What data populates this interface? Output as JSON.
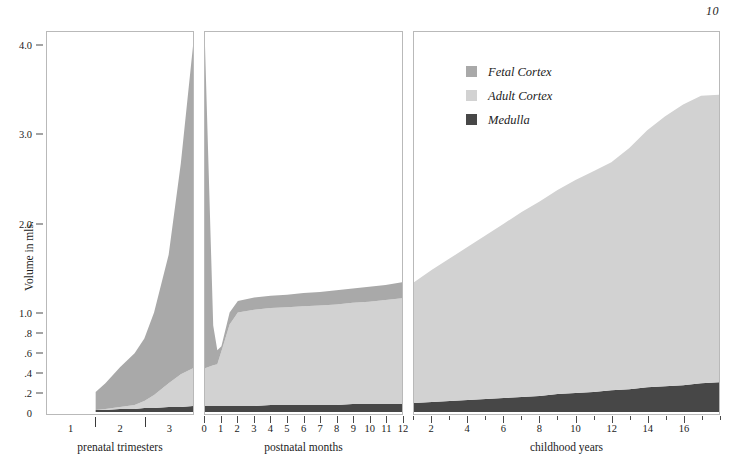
{
  "folio": "10",
  "axis_title": "Volume in mls.",
  "legend": {
    "items": [
      {
        "label": "Fetal Cortex",
        "color": "#a9a9a9"
      },
      {
        "label": "Adult Cortex",
        "color": "#d2d2d2"
      },
      {
        "label": "Medulla",
        "color": "#474747"
      }
    ]
  },
  "colors": {
    "fetal_cortex": "#a9a9a9",
    "adult_cortex": "#d2d2d2",
    "medulla": "#474747",
    "panel_border": "#b9b9b9",
    "tick": "#4a4a4a",
    "text": "#1c1c1c"
  },
  "yaxis": {
    "label": "Volume in mls.",
    "ticks": [
      {
        "value": 4.0,
        "label": "4.0"
      },
      {
        "value": 3.0,
        "label": "3.0"
      },
      {
        "value": 2.0,
        "label": "2.0"
      },
      {
        "value": 1.0,
        "label": "1.0"
      },
      {
        "value": 0.8,
        "label": ".8"
      },
      {
        "value": 0.6,
        "label": ".6"
      },
      {
        "value": 0.4,
        "label": ".4"
      },
      {
        "value": 0.2,
        "label": ".2"
      },
      {
        "value": 0.0,
        "label": "0"
      }
    ],
    "broken_scale": true,
    "lower_range": [
      0.0,
      1.0
    ],
    "upper_range": [
      1.0,
      4.2
    ],
    "units": "mls."
  },
  "panels": [
    {
      "id": "prenatal",
      "caption": "prenatal trimesters",
      "xlim": [
        0,
        3
      ],
      "tick_labels": [
        "1",
        "2",
        "3"
      ],
      "tick_label_positions": [
        0.5,
        1.5,
        2.5
      ],
      "separators": [
        1,
        2
      ]
    },
    {
      "id": "postnatal",
      "caption": "postnatal months",
      "xlim": [
        0,
        12
      ],
      "tick_labels": [
        "0",
        "1",
        "2",
        "3",
        "4",
        "5",
        "6",
        "7",
        "8",
        "9",
        "10",
        "11",
        "12"
      ],
      "tick_label_positions": [
        0,
        1,
        2,
        3,
        4,
        5,
        6,
        7,
        8,
        9,
        10,
        11,
        12
      ]
    },
    {
      "id": "childhood",
      "caption": "childhood years",
      "xlim": [
        1,
        18
      ],
      "tick_labels": [
        "2",
        "4",
        "6",
        "8",
        "10",
        "12",
        "14",
        "16"
      ],
      "tick_label_positions": [
        2,
        4,
        6,
        8,
        10,
        12,
        14,
        16
      ],
      "minor_ticks": [
        1,
        3,
        5,
        7,
        9,
        11,
        13,
        15,
        17,
        18
      ]
    }
  ],
  "chart_data": {
    "type": "area",
    "xlabel": "",
    "ylabel": "Volume in mls.",
    "ylim": [
      0,
      4.2
    ],
    "stacked": true,
    "grid": false,
    "legend_position": "top-right-inside-panel-3",
    "series_order": [
      "Medulla",
      "Adult Cortex",
      "Fetal Cortex"
    ],
    "panels": [
      {
        "name": "prenatal trimesters",
        "xlabel": "prenatal trimesters",
        "xlim": [
          0,
          3
        ],
        "x": [
          1.0,
          1.2,
          1.5,
          1.8,
          2.0,
          2.2,
          2.5,
          2.75,
          3.0
        ],
        "series": [
          {
            "name": "Medulla",
            "values": [
              0.02,
              0.02,
              0.03,
              0.03,
              0.04,
              0.04,
              0.05,
              0.05,
              0.06
            ]
          },
          {
            "name": "Adult Cortex",
            "values": [
              0.0,
              0.01,
              0.02,
              0.04,
              0.07,
              0.13,
              0.24,
              0.33,
              0.38
            ]
          },
          {
            "name": "Fetal Cortex",
            "values": [
              0.18,
              0.26,
              0.4,
              0.52,
              0.63,
              0.83,
              1.36,
              2.3,
              3.56
            ]
          }
        ],
        "totals": [
          0.2,
          0.29,
          0.45,
          0.59,
          0.74,
          1.0,
          1.65,
          2.68,
          4.0
        ]
      },
      {
        "name": "postnatal months",
        "xlabel": "postnatal months",
        "xlim": [
          0,
          12
        ],
        "x": [
          0,
          0.5,
          0.75,
          1.0,
          1.5,
          2.0,
          3.0,
          4.0,
          5.0,
          6.0,
          7.0,
          8.0,
          9.0,
          10.0,
          11.0,
          12.0
        ],
        "series": [
          {
            "name": "Medulla",
            "values": [
              0.06,
              0.06,
              0.06,
              0.06,
              0.06,
              0.06,
              0.06,
              0.07,
              0.07,
              0.07,
              0.07,
              0.07,
              0.08,
              0.08,
              0.08,
              0.08
            ]
          },
          {
            "name": "Adult Cortex",
            "values": [
              0.38,
              0.41,
              0.42,
              0.55,
              0.82,
              0.94,
              0.97,
              0.98,
              0.99,
              1.0,
              1.01,
              1.02,
              1.03,
              1.04,
              1.06,
              1.08
            ]
          },
          {
            "name": "Fetal Cortex",
            "values": [
              3.56,
              0.4,
              0.14,
              0.05,
              0.12,
              0.13,
              0.14,
              0.14,
              0.14,
              0.15,
              0.15,
              0.16,
              0.16,
              0.17,
              0.17,
              0.18
            ]
          }
        ],
        "totals": [
          4.0,
          0.87,
          0.62,
          0.66,
          1.0,
          1.13,
          1.17,
          1.19,
          1.2,
          1.22,
          1.23,
          1.25,
          1.27,
          1.29,
          1.31,
          1.34
        ]
      },
      {
        "name": "childhood years",
        "xlabel": "childhood years",
        "xlim": [
          1,
          18
        ],
        "x": [
          1,
          2,
          3,
          4,
          5,
          6,
          7,
          8,
          9,
          10,
          11,
          12,
          13,
          14,
          15,
          16,
          17,
          18
        ],
        "series": [
          {
            "name": "Medulla",
            "values": [
              0.09,
              0.1,
              0.11,
              0.12,
              0.13,
              0.14,
              0.15,
              0.16,
              0.18,
              0.19,
              0.2,
              0.22,
              0.23,
              0.25,
              0.26,
              0.27,
              0.29,
              0.3
            ]
          },
          {
            "name": "Adult Cortex",
            "values": [
              1.25,
              1.38,
              1.5,
              1.62,
              1.74,
              1.86,
              1.98,
              2.09,
              2.2,
              2.3,
              2.39,
              2.47,
              2.62,
              2.8,
              2.95,
              3.07,
              3.15,
              3.15
            ]
          },
          {
            "name": "Fetal Cortex",
            "values": [
              0.0,
              0.0,
              0.0,
              0.0,
              0.0,
              0.0,
              0.0,
              0.0,
              0.0,
              0.0,
              0.0,
              0.0,
              0.0,
              0.0,
              0.0,
              0.0,
              0.0,
              0.0
            ]
          }
        ],
        "totals": [
          1.34,
          1.48,
          1.61,
          1.74,
          1.87,
          2.0,
          2.13,
          2.25,
          2.38,
          2.49,
          2.59,
          2.69,
          2.85,
          3.05,
          3.21,
          3.34,
          3.44,
          3.45
        ]
      }
    ]
  }
}
